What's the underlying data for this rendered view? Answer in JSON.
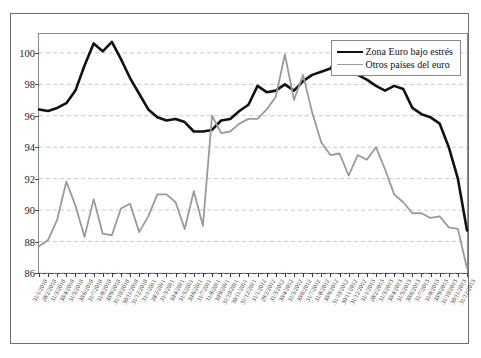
{
  "chart_data": {
    "type": "line",
    "title": "",
    "xlabel": "",
    "ylabel": "",
    "ylim": [
      86,
      101.2
    ],
    "yticks": [
      86,
      88,
      90,
      92,
      94,
      96,
      98,
      100
    ],
    "ytick_labels": [
      "86",
      "88",
      "90",
      "92",
      "94",
      "96",
      "98",
      "100"
    ],
    "grid": true,
    "grid_style": "dashed",
    "legend_position": "top-right",
    "colors": {
      "stressed": "#111111",
      "others": "#9a9a9a",
      "grid": "#c9c9c9",
      "frame": "#8a8a8a",
      "axis": "#3a3a3a"
    },
    "categories": [
      "31/1/2010",
      "28/2/2010",
      "31/3/2010",
      "30/4/2010",
      "31/5/2010",
      "30/6/2010",
      "31/7/2010",
      "31/8/2010",
      "30/9/2010",
      "31/10/2010",
      "30/11/2010",
      "31/12/2010",
      "31/1/2011",
      "28/2/2011",
      "31/3/2011",
      "30/4/2011",
      "31/5/2011",
      "30/6/2011",
      "31/7/2011",
      "31/8/2011",
      "30/9/2011",
      "31/10/2011",
      "30/11/2011",
      "31/12/2011",
      "31/1/2012",
      "29/2/2012",
      "31/3/2012",
      "30/4/2012",
      "31/5/2012",
      "30/6/2012",
      "31/7/2012",
      "31/8/2012",
      "30/9/2012",
      "31/10/2012",
      "30/11/2012",
      "31/12/2012",
      "31/1/2013",
      "28/2/2013",
      "31/3/2013",
      "30/4/2013",
      "31/5/2013",
      "30/6/2013",
      "31/7/2013",
      "31/8/2013",
      "30/9/2013",
      "31/10/2013",
      "30/11/2013",
      "31/12/2013"
    ],
    "series": [
      {
        "name": "Zona Euro bajo estrés",
        "color": "#111111",
        "width": 2.6,
        "values": [
          96.4,
          96.3,
          96.5,
          96.8,
          97.6,
          99.2,
          100.6,
          100.1,
          100.7,
          99.6,
          98.4,
          97.4,
          96.4,
          95.9,
          95.7,
          95.8,
          95.6,
          95.0,
          95.0,
          95.1,
          95.7,
          95.8,
          96.3,
          96.7,
          97.9,
          97.5,
          97.6,
          98.0,
          97.6,
          98.2,
          98.6,
          98.8,
          99.0,
          99.9,
          99.3,
          98.6,
          98.3,
          97.9,
          97.6,
          97.9,
          97.7,
          96.5,
          96.1,
          95.9,
          95.5,
          94.0,
          92.0,
          88.7
        ]
      },
      {
        "name": "Otros paises del euro",
        "color": "#9a9a9a",
        "width": 1.8,
        "values": [
          87.7,
          88.1,
          89.4,
          91.8,
          90.3,
          88.3,
          90.7,
          88.5,
          88.4,
          90.1,
          90.4,
          88.6,
          89.6,
          91.0,
          91.0,
          90.5,
          88.8,
          91.2,
          89.0,
          96.0,
          94.9,
          95.0,
          95.5,
          95.8,
          95.8,
          96.4,
          97.2,
          99.9,
          97.0,
          98.6,
          96.2,
          94.3,
          93.5,
          93.6,
          92.2,
          93.5,
          93.2,
          94.0,
          92.6,
          91.0,
          90.5,
          89.8,
          89.8,
          89.5,
          89.6,
          88.9,
          88.8,
          86.3
        ]
      }
    ]
  },
  "legend": {
    "items": [
      {
        "label": "Zona Euro bajo estrés"
      },
      {
        "label": "Otros paises del euro"
      }
    ]
  }
}
